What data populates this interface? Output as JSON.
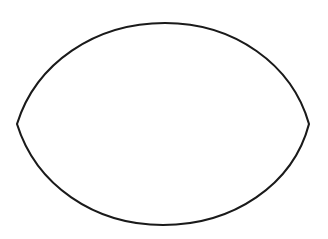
{
  "figure": {
    "title": "Lens (vesica piscis) outline",
    "shape_name": "lens-shape",
    "background_color": "#ffffff",
    "stroke_color": "#1a1a1a",
    "fill_color": "none",
    "stroke_width": 2.1,
    "canvas": {
      "width": 328,
      "height": 239
    },
    "geometry": {
      "left_cusp": {
        "x": 17,
        "y": 124
      },
      "right_cusp": {
        "x": 309,
        "y": 124
      },
      "top_apex": {
        "x": 165,
        "y": 23
      },
      "bottom_apex": {
        "x": 163,
        "y": 225
      },
      "horizontal_span": 292,
      "vertical_span": 202,
      "upper_arc_path": "M 17 124 C 36 63, 95 23, 165 23 C 234 23, 292 64, 309 124",
      "lower_arc_path": "C 293 185, 233 225, 163 225 C 94 225, 36 185, 17 124",
      "full_path": "M 17 124 C 36 63, 95 23, 165 23 C 234 23, 292 64, 309 124 C 293 185, 233 225, 163 225 C 94 225, 36 185, 17 124 Z"
    }
  }
}
